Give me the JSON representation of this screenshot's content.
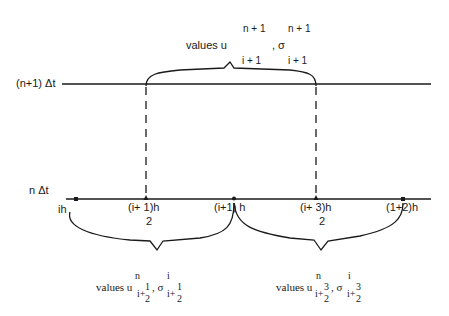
{
  "diagram": {
    "top_line": {
      "label": "(n+1) Δt"
    },
    "bottom_line": {
      "label": "n Δt"
    },
    "top_annotation": {
      "prefix": "values u",
      "u_sup": "n + 1",
      "u_sub": "i + 1",
      "sep": ", σ",
      "sigma_sup": "n + 1",
      "sigma_sub": "i + 1"
    },
    "grid_points": [
      {
        "label": "ih"
      },
      {
        "label": "(i+ 1)h",
        "denominator": "2"
      },
      {
        "label": "(i+1) h"
      },
      {
        "label": "(i+ 3)h",
        "denominator": "2"
      },
      {
        "label": "(1+2)h"
      }
    ],
    "bottom_annotations": [
      {
        "prefix": "values u",
        "u_sup": "n",
        "u_sub": "i+",
        "u_frac_num": "1",
        "u_frac_den": "2",
        "sep": ", σ",
        "sigma_sup": "i",
        "sigma_sub": "i+",
        "sigma_frac_num": "1",
        "sigma_frac_den": "2"
      },
      {
        "prefix": "values u",
        "u_sup": "n",
        "u_sub": "i+",
        "u_frac_num": "3",
        "u_frac_den": "2",
        "sep": ", σ",
        "sigma_sup": "i",
        "sigma_sub": "i+",
        "sigma_frac_num": "3",
        "sigma_frac_den": "2"
      }
    ],
    "colors": {
      "ink": "#1a1a1a",
      "background": "#ffffff"
    }
  }
}
